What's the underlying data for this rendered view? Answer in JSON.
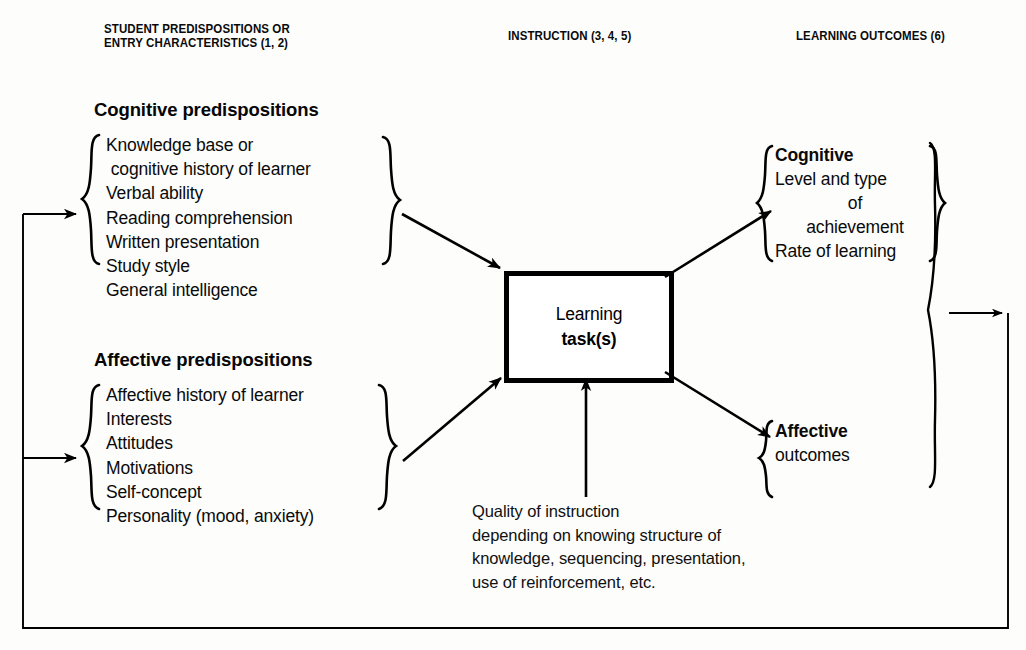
{
  "columns": {
    "left_header": "STUDENT PREDISPOSITIONS OR\nENTRY CHARACTERISTICS (1, 2)",
    "center_header": "INSTRUCTION (3, 4, 5)",
    "right_header": "LEARNING OUTCOMES (6)"
  },
  "cognitive_group": {
    "title": "Cognitive predispositions",
    "items": [
      "Knowledge base or",
      " cognitive history of learner",
      "Verbal ability",
      "Reading comprehension",
      "Written presentation",
      "Study style",
      "General intelligence"
    ]
  },
  "affective_group": {
    "title": "Affective predispositions",
    "items": [
      "Affective history of learner",
      "Interests",
      "Attitudes",
      "Motivations",
      "Self-concept",
      "Personality (mood, anxiety)"
    ]
  },
  "task_box": {
    "line1": "Learning",
    "line2": "task(s)"
  },
  "instruction_caption": {
    "lines": [
      "Quality of instruction",
      "depending on knowing structure of",
      "knowledge, sequencing, presentation,",
      "use of reinforcement, etc."
    ]
  },
  "cognitive_outcomes": {
    "heading": "Cognitive",
    "lines": [
      "Level and type",
      "of",
      "achievement",
      "Rate of learning"
    ]
  },
  "affective_outcomes": {
    "heading": "Affective",
    "lines": [
      "outcomes"
    ]
  },
  "colors": {
    "ink": "#000000",
    "page": "#fdfdfb"
  }
}
